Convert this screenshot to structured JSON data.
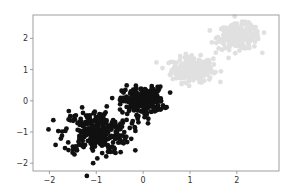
{
  "chart_data": {
    "type": "scatter",
    "title": "",
    "xlabel": "",
    "ylabel": "",
    "xlim": [
      -2.35,
      2.9
    ],
    "ylim": [
      -2.25,
      2.75
    ],
    "grid": false,
    "legend": null,
    "xticks": [
      -2,
      -1,
      0,
      1,
      2
    ],
    "yticks": [
      -2,
      -1,
      0,
      1,
      2
    ],
    "xtick_labels": [
      "−2",
      "−1",
      "0",
      "1",
      "2"
    ],
    "ytick_labels": [
      "−2",
      "−1",
      "0",
      "1",
      "2"
    ],
    "series": [
      {
        "name": "cluster-dark-1",
        "color": "#111111",
        "center": [
          -1.0,
          -1.0
        ],
        "std": [
          0.35,
          0.35
        ],
        "n": 300,
        "marker_size": 2.4
      },
      {
        "name": "cluster-dark-2",
        "color": "#111111",
        "center": [
          0.0,
          0.0
        ],
        "std": [
          0.22,
          0.22
        ],
        "n": 250,
        "marker_size": 2.4
      },
      {
        "name": "cluster-light-1",
        "color": "#e0e0e0",
        "center": [
          1.05,
          1.0
        ],
        "std": [
          0.22,
          0.2
        ],
        "n": 250,
        "marker_size": 2.4
      },
      {
        "name": "cluster-light-2",
        "color": "#e0e0e0",
        "center": [
          2.05,
          2.05
        ],
        "std": [
          0.22,
          0.2
        ],
        "n": 250,
        "marker_size": 2.4
      }
    ]
  },
  "layout": {
    "plot_left": 33,
    "plot_right": 279,
    "plot_top": 15,
    "plot_bottom": 171,
    "frame_color": "#888888",
    "background": "#ffffff"
  }
}
